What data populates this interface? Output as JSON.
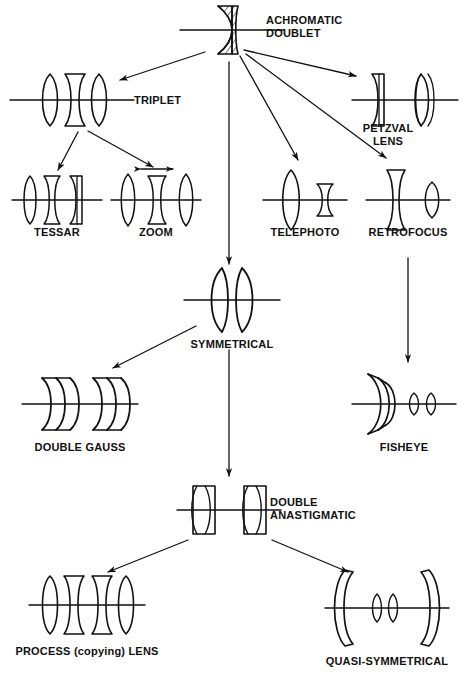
{
  "diagram": {
    "background": "#ffffff",
    "ink": "#111111",
    "nodes": [
      {
        "id": "achromatic-doublet",
        "label": "ACHROMATIC",
        "label2": "DOUBLET",
        "x": 232,
        "y": 30,
        "label_x": 266,
        "label_y": 20,
        "label_align": "left",
        "optic": "achromatic-doublet-hatched",
        "axis_half_width": 52
      },
      {
        "id": "triplet",
        "label": "TRIPLET",
        "label2": "",
        "x": 72,
        "y": 100,
        "label_x": 134,
        "label_y": 94,
        "label_align": "left",
        "optic": "triplet",
        "axis_half_width": 62
      },
      {
        "id": "petzval-lens",
        "label": "PETZVAL",
        "label2": "LENS",
        "x": 406,
        "y": 100,
        "label_x": 388,
        "label_y": 122,
        "label_align": "center",
        "optic": "petzval",
        "axis_half_width": 52
      },
      {
        "id": "tessar",
        "label": "TESSAR",
        "label2": "",
        "x": 57,
        "y": 200,
        "label_x": 57,
        "label_y": 226,
        "label_align": "center",
        "optic": "tessar",
        "axis_half_width": 45
      },
      {
        "id": "zoom",
        "label": "ZOOM",
        "label2": "",
        "x": 156,
        "y": 200,
        "label_x": 156,
        "label_y": 226,
        "label_align": "center",
        "optic": "zoom",
        "axis_half_width": 45
      },
      {
        "id": "telephoto",
        "label": "TELEPHOTO",
        "label2": "",
        "x": 305,
        "y": 200,
        "label_x": 305,
        "label_y": 226,
        "label_align": "center",
        "optic": "telephoto",
        "axis_half_width": 42
      },
      {
        "id": "retrofocus",
        "label": "RETROFOCUS",
        "label2": "",
        "x": 408,
        "y": 200,
        "label_x": 408,
        "label_y": 226,
        "label_align": "center",
        "optic": "retrofocus",
        "axis_half_width": 42
      },
      {
        "id": "symmetrical",
        "label": "SYMMETRICAL",
        "label2": "",
        "x": 232,
        "y": 300,
        "label_x": 232,
        "label_y": 338,
        "label_align": "center",
        "optic": "symmetrical",
        "axis_half_width": 48
      },
      {
        "id": "double-gauss",
        "label": "DOUBLE GAUSS",
        "label2": "",
        "x": 80,
        "y": 404,
        "label_x": 80,
        "label_y": 441,
        "label_align": "center",
        "optic": "double-gauss",
        "axis_half_width": 58
      },
      {
        "id": "fisheye",
        "label": "FISHEYE",
        "label2": "",
        "x": 404,
        "y": 404,
        "label_x": 404,
        "label_y": 441,
        "label_align": "center",
        "optic": "fisheye",
        "axis_half_width": 52
      },
      {
        "id": "double-anastigmatic",
        "label": "DOUBLE",
        "label2": "ANASTIGMATIC",
        "x": 229,
        "y": 510,
        "label_x": 268,
        "label_y": 499,
        "label_align": "left",
        "optic": "double-anastigmatic",
        "axis_half_width": 52
      },
      {
        "id": "process-copying-lens",
        "label": "PROCESS (copying) LENS",
        "label2": "",
        "x": 87,
        "y": 605,
        "label_x": 87,
        "label_y": 645,
        "label_align": "center",
        "optic": "process-lens",
        "axis_half_width": 58
      },
      {
        "id": "quasi-symmetrical",
        "label": "QUASI-SYMMETRICAL",
        "label2": "",
        "x": 387,
        "y": 608,
        "label_x": 387,
        "label_y": 655,
        "label_align": "center",
        "optic": "quasi-symmetrical",
        "axis_half_width": 62
      }
    ],
    "edges": [
      {
        "id": "doublet-to-triplet",
        "from": "achromatic-doublet",
        "to": "triplet",
        "kind": "arrow"
      },
      {
        "id": "doublet-to-petzval",
        "from": "achromatic-doublet",
        "to": "petzval-lens",
        "kind": "arrow"
      },
      {
        "id": "doublet-to-telephoto",
        "from": "achromatic-doublet",
        "to": "telephoto",
        "kind": "arrow"
      },
      {
        "id": "doublet-to-retrofocus",
        "from": "achromatic-doublet",
        "to": "retrofocus",
        "kind": "arrow"
      },
      {
        "id": "doublet-to-symmetrical",
        "from": "achromatic-doublet",
        "to": "symmetrical",
        "kind": "arrow"
      },
      {
        "id": "triplet-to-tessar",
        "from": "triplet",
        "to": "tessar",
        "kind": "arrow"
      },
      {
        "id": "triplet-to-zoom",
        "from": "triplet",
        "to": "zoom",
        "kind": "arrow"
      },
      {
        "id": "retrofocus-to-fisheye",
        "from": "retrofocus",
        "to": "fisheye",
        "kind": "arrow"
      },
      {
        "id": "symmetrical-to-double-gauss",
        "from": "symmetrical",
        "to": "double-gauss",
        "kind": "arrow"
      },
      {
        "id": "symmetrical-to-anastigmatic",
        "from": "symmetrical",
        "to": "double-anastigmatic",
        "kind": "arrow"
      },
      {
        "id": "anastigmatic-to-process",
        "from": "double-anastigmatic",
        "to": "process-copying-lens",
        "kind": "arrow"
      },
      {
        "id": "anastigmatic-to-quasi",
        "from": "double-anastigmatic",
        "to": "quasi-symmetrical",
        "kind": "arrow"
      }
    ],
    "annotations": [
      {
        "id": "zoom-motion-arrow",
        "label": "",
        "note": "double-headed arrow above zoom middle group"
      }
    ]
  }
}
